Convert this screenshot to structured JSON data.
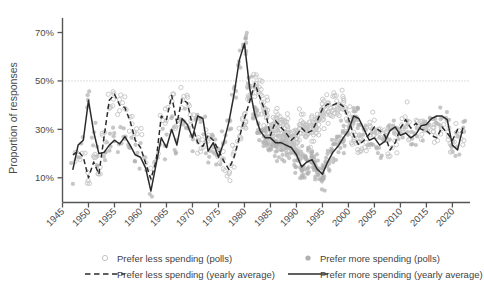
{
  "chart_data": {
    "type": "line",
    "title": "",
    "subtitle": "",
    "xlabel": "",
    "ylabel": "Proportion of responses",
    "xlim": [
      1945,
      2023
    ],
    "ylim": [
      0.0,
      0.76
    ],
    "grid": false,
    "reference_lines": [
      {
        "axis": "y",
        "value": 0.5,
        "style": "dotted",
        "color": "#b9b9b9"
      }
    ],
    "yticks": [
      0.1,
      0.3,
      0.5,
      0.7
    ],
    "ytick_labels": [
      "10%",
      "30%",
      "50%",
      "70%"
    ],
    "xticks": [
      1945,
      1950,
      1955,
      1960,
      1965,
      1970,
      1975,
      1980,
      1985,
      1990,
      1995,
      2000,
      2005,
      2010,
      2015,
      2020
    ],
    "xtick_labels": [
      "1945",
      "1950",
      "1955",
      "1960",
      "1965",
      "1970",
      "1975",
      "1980",
      "1985",
      "1990",
      "1995",
      "2000",
      "2005",
      "2010",
      "2015",
      "2020"
    ],
    "legend_position": "bottom",
    "legend": [
      {
        "label": "Prefer less spending (polls)",
        "marker": "open-circle",
        "color": "#c9c9c9"
      },
      {
        "label": "Prefer more spending (polls)",
        "marker": "filled-circle",
        "color": "#b5b5b5"
      },
      {
        "label": "Prefer less spending (yearly average)",
        "marker": "dashed-line",
        "color": "#2b2b2b"
      },
      {
        "label": "Prefer more spending (yearly average)",
        "marker": "solid-line",
        "color": "#2b2b2b"
      }
    ],
    "series": [
      {
        "name": "Prefer less spending (yearly average)",
        "style": "dashed",
        "x": [
          1947,
          1948,
          1949,
          1950,
          1951,
          1952,
          1953,
          1954,
          1955,
          1956,
          1957,
          1958,
          1959,
          1960,
          1961,
          1962,
          1963,
          1964,
          1965,
          1966,
          1967,
          1968,
          1969,
          1970,
          1971,
          1972,
          1973,
          1974,
          1975,
          1976,
          1977,
          1978,
          1979,
          1980,
          1981,
          1982,
          1983,
          1984,
          1985,
          1986,
          1987,
          1988,
          1989,
          1990,
          1991,
          1992,
          1993,
          1994,
          1995,
          1996,
          1997,
          1998,
          1999,
          2000,
          2001,
          2002,
          2003,
          2004,
          2005,
          2006,
          2007,
          2008,
          2009,
          2010,
          2011,
          2012,
          2013,
          2014,
          2015,
          2016,
          2017,
          2018,
          2019,
          2020,
          2021,
          2022
        ],
        "values": [
          0.195,
          0.21,
          0.185,
          0.1,
          0.165,
          0.115,
          0.27,
          0.42,
          0.445,
          0.4,
          0.39,
          0.335,
          0.255,
          0.225,
          0.16,
          0.095,
          0.17,
          0.355,
          0.34,
          0.44,
          0.325,
          0.425,
          0.41,
          0.315,
          0.245,
          0.23,
          0.275,
          0.255,
          0.215,
          0.17,
          0.135,
          0.185,
          0.265,
          0.345,
          0.415,
          0.49,
          0.43,
          0.375,
          0.275,
          0.335,
          0.31,
          0.285,
          0.255,
          0.275,
          0.305,
          0.285,
          0.295,
          0.335,
          0.385,
          0.405,
          0.4,
          0.41,
          0.395,
          0.345,
          0.275,
          0.235,
          0.255,
          0.28,
          0.31,
          0.295,
          0.275,
          0.215,
          0.245,
          0.305,
          0.34,
          0.305,
          0.325,
          0.3,
          0.295,
          0.275,
          0.265,
          0.31,
          0.285,
          0.255,
          0.3,
          0.285
        ]
      },
      {
        "name": "Prefer more spending (yearly average)",
        "style": "solid",
        "x": [
          1947,
          1948,
          1949,
          1950,
          1951,
          1952,
          1953,
          1954,
          1955,
          1956,
          1957,
          1958,
          1959,
          1960,
          1961,
          1962,
          1963,
          1964,
          1965,
          1966,
          1967,
          1968,
          1969,
          1970,
          1971,
          1972,
          1973,
          1974,
          1975,
          1976,
          1977,
          1978,
          1979,
          1980,
          1981,
          1982,
          1983,
          1984,
          1985,
          1986,
          1987,
          1988,
          1989,
          1990,
          1991,
          1992,
          1993,
          1994,
          1995,
          1996,
          1997,
          1998,
          1999,
          2000,
          2001,
          2002,
          2003,
          2004,
          2005,
          2006,
          2007,
          2008,
          2009,
          2010,
          2011,
          2012,
          2013,
          2014,
          2015,
          2016,
          2017,
          2018,
          2019,
          2020,
          2021,
          2022
        ],
        "values": [
          0.135,
          0.235,
          0.255,
          0.42,
          0.29,
          0.2,
          0.205,
          0.235,
          0.255,
          0.24,
          0.27,
          0.235,
          0.195,
          0.185,
          0.14,
          0.045,
          0.155,
          0.265,
          0.225,
          0.3,
          0.235,
          0.345,
          0.32,
          0.265,
          0.355,
          0.345,
          0.21,
          0.245,
          0.185,
          0.245,
          0.33,
          0.445,
          0.585,
          0.655,
          0.47,
          0.36,
          0.295,
          0.265,
          0.265,
          0.245,
          0.245,
          0.235,
          0.225,
          0.195,
          0.145,
          0.165,
          0.175,
          0.135,
          0.115,
          0.165,
          0.205,
          0.23,
          0.265,
          0.295,
          0.355,
          0.345,
          0.3,
          0.255,
          0.265,
          0.235,
          0.25,
          0.295,
          0.31,
          0.275,
          0.285,
          0.265,
          0.28,
          0.315,
          0.32,
          0.345,
          0.355,
          0.355,
          0.34,
          0.235,
          0.215,
          0.305
        ]
      }
    ],
    "scatter": [
      {
        "name": "Prefer less spending (polls)",
        "marker": "open-circle",
        "color": "#c4c4c4",
        "note": "Individual poll results, scattered around the dashed yearly-average line; dense from 1980 onward, sparse before 1965."
      },
      {
        "name": "Prefer more spending (polls)",
        "marker": "filled-circle",
        "color": "#b0b0b0",
        "note": "Individual poll results, scattered around the solid yearly-average line; dense from 1980 onward, outliers up to ~73%."
      }
    ]
  },
  "axes": {
    "ylabel": "Proportion of responses"
  },
  "colors": {
    "line": "#2b2b2b",
    "axis": "#555555",
    "open_marker": "#c4c4c4",
    "filled_marker": "#b0b0b0",
    "reference": "#bdbdbd",
    "background": "#ffffff"
  }
}
